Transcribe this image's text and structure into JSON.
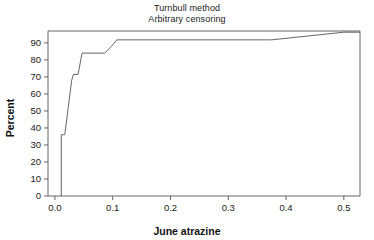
{
  "chart_data": {
    "type": "line",
    "subtype": "step-cdf",
    "title": "Turnbull method",
    "subtitle": "Arbitrary censoring",
    "xlabel": "June atrazine",
    "ylabel": "Percent",
    "xlim": [
      -0.012,
      0.528
    ],
    "ylim": [
      0,
      97
    ],
    "grid": false,
    "legend": null,
    "xticks": [
      0.0,
      0.1,
      0.2,
      0.3,
      0.4,
      0.5
    ],
    "xticklabels": [
      "0.0",
      "0.1",
      "0.2",
      "0.3",
      "0.4",
      "0.5"
    ],
    "yticks": [
      0,
      10,
      20,
      30,
      40,
      50,
      60,
      70,
      80,
      90
    ],
    "yticklabels": [
      "0",
      "10",
      "20",
      "30",
      "40",
      "50",
      "60",
      "70",
      "80",
      "90"
    ],
    "line_color": "#555555",
    "line_width": 0.9,
    "series": [
      {
        "name": "Turnbull CDF",
        "x": [
          0.011,
          0.011,
          0.017,
          0.023,
          0.029,
          0.032,
          0.04,
          0.047,
          0.086,
          0.098,
          0.107,
          0.375,
          0.5,
          0.528
        ],
        "y": [
          0.0,
          36.0,
          36.0,
          52.0,
          68.0,
          71.5,
          71.5,
          84.0,
          84.0,
          88.0,
          91.8,
          91.8,
          96.3,
          96.3
        ],
        "steps": [
          {
            "x": 0.011,
            "percent": 36.0
          },
          {
            "x": 0.017,
            "percent": 52.0
          },
          {
            "x": 0.023,
            "percent": 68.0
          },
          {
            "x": 0.029,
            "percent": 71.5
          },
          {
            "x": 0.047,
            "percent": 84.0
          },
          {
            "x": 0.098,
            "percent": 88.0
          },
          {
            "x": 0.107,
            "percent": 91.8
          },
          {
            "x": 0.375,
            "percent": 96.3
          }
        ]
      }
    ]
  },
  "figure": {
    "background": "#ffffff",
    "frame_color": "#555555"
  }
}
